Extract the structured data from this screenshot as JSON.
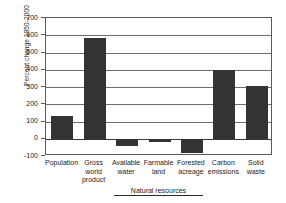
{
  "chart_data": {
    "type": "bar",
    "title": "",
    "xlabel": "",
    "ylabel": "Percent change 1950-2000",
    "ylim": [
      -100,
      700
    ],
    "ytick_step": 100,
    "yticks": [
      700,
      600,
      500,
      400,
      300,
      200,
      100,
      0,
      -100
    ],
    "ytick_labels": [
      "700",
      "600",
      "500",
      "400",
      "300",
      "200",
      "100",
      "0",
      "-100"
    ],
    "grid": true,
    "legend": "none",
    "bar_color": "#333333",
    "axis_color": "#5a5a5a",
    "categories": [
      "Population",
      "Gross world product",
      "Available water",
      "Farmable land",
      "Forested acreage",
      "Carbon emissions",
      "Solid waste"
    ],
    "category_lines": [
      [
        "Population"
      ],
      [
        "Gross",
        "world",
        "product"
      ],
      [
        "Available",
        "water"
      ],
      [
        "Farmable",
        "land"
      ],
      [
        "Forested",
        "acreage"
      ],
      [
        "Carbon",
        "emissions"
      ],
      [
        "Solid",
        "waste"
      ]
    ],
    "values": [
      130,
      585,
      -40,
      -20,
      -80,
      400,
      305
    ],
    "annotations": [
      {
        "label": "Natural resources",
        "spans_categories": [
          "Available water",
          "Farmable land",
          "Forested acreage"
        ],
        "style": "bracket-below-axis"
      }
    ]
  }
}
